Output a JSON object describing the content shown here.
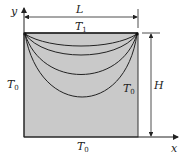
{
  "diagram": {
    "axes": {
      "x_label": "x",
      "y_label": "y"
    },
    "dimensions": {
      "width_label": "L",
      "height_label": "H"
    },
    "boundaries": {
      "top": {
        "label": "T",
        "subscript": "1"
      },
      "left": {
        "label": "T",
        "subscript": "0"
      },
      "right": {
        "label": "T",
        "subscript": "0"
      },
      "bottom": {
        "label": "T",
        "subscript": "0"
      }
    },
    "isotherm_count": 4,
    "colors": {
      "plate_fill": "#c9c9c9",
      "lines": "#222222"
    }
  }
}
